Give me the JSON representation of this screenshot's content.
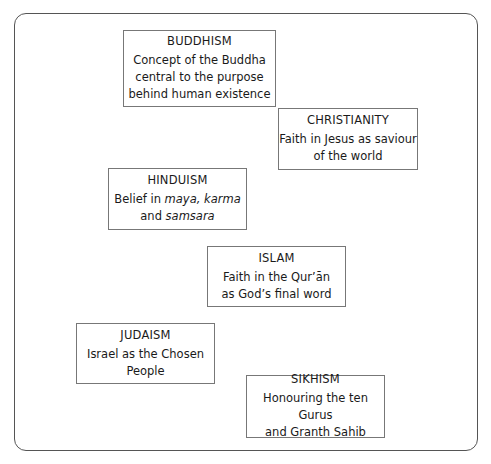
{
  "diagram": {
    "top_cut_text": "Figure: The central belief of each major religion",
    "boxes": [
      {
        "id": "buddhism",
        "title": "BUDDHISM",
        "lines": [
          "Concept of the Buddha",
          "central to the purpose",
          "behind human existence"
        ]
      },
      {
        "id": "christianity",
        "title": "CHRISTIANITY",
        "lines": [
          "Faith in Jesus as saviour",
          "of the world"
        ]
      },
      {
        "id": "hinduism",
        "title": "HINDUISM",
        "line1_prefix": "Belief in ",
        "line1_italic": "maya, karma",
        "line2_prefix": "and ",
        "line2_italic": "samsara"
      },
      {
        "id": "islam",
        "title": "ISLAM",
        "lines": [
          "Faith in the Qur’ān",
          "as God’s final word"
        ]
      },
      {
        "id": "judaism",
        "title": "JUDAISM",
        "lines": [
          "Israel as the Chosen",
          "People"
        ]
      },
      {
        "id": "sikhism",
        "title": "SIKHISM",
        "lines": [
          "Honouring the ten Gurus",
          "and Granth Sahib"
        ]
      }
    ]
  }
}
